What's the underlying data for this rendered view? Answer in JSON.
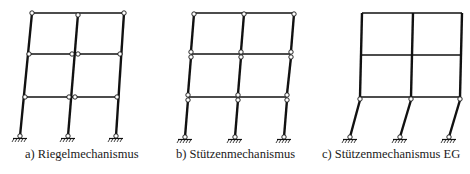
{
  "diagrams": [
    {
      "id": "a",
      "caption": "a) Riegelmechanismus",
      "caption_x": 25,
      "description": "Beam mechanism: plastic hinges at beam ends on each floor, columns tilt as a whole"
    },
    {
      "id": "b",
      "caption": "b) Stützenmechanismus",
      "caption_x": 176,
      "description": "Column mechanism: plastic hinges at top and bottom of columns in every storey"
    },
    {
      "id": "c",
      "caption": "c) Stützenmechanismus EG",
      "caption_x": 322,
      "description": "Ground floor column mechanism: hinges only in ground-floor columns, upper frame rigid"
    }
  ],
  "colors": {
    "stroke": "#111111",
    "hinge_fill": "#ffffff",
    "text": "#1a1a1a"
  }
}
